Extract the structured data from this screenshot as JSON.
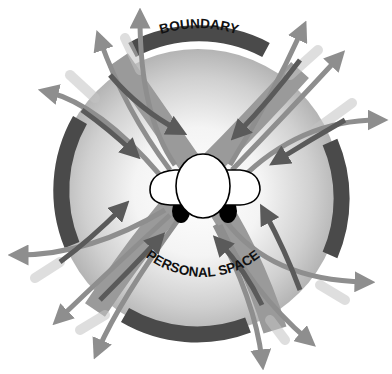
{
  "diagram": {
    "labels": {
      "boundary": "BOUNDARY",
      "personal_space": "PERSONAL SPACE"
    },
    "figure": {
      "subject": "person-top-down-view",
      "center_region": "personal space circle",
      "boundary_segments": 4,
      "crossing_bands": 2
    },
    "arrows": {
      "inward_count": 8,
      "outward_count": 12,
      "inward_color": "#5a5a5a",
      "outward_color": "#8e8e8e"
    },
    "colors": {
      "background": "#ffffff",
      "space_outer": "#bdbdbd",
      "space_inner": "#ffffff",
      "boundary_arc": "#4a4a4a",
      "band": "#9a9a9a",
      "person_fill": "#ffffff",
      "person_outline": "#000000",
      "feet": "#000000"
    }
  }
}
